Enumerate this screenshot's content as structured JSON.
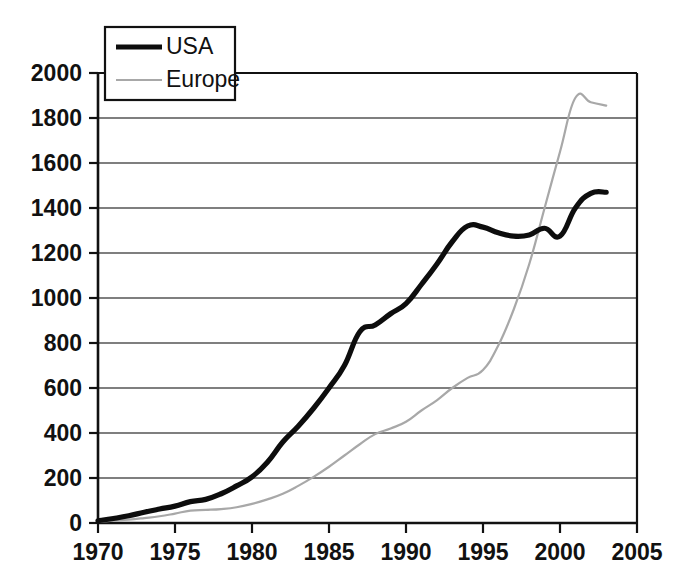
{
  "chart_data": {
    "type": "line",
    "title": "",
    "subtitle": "",
    "xlabel": "",
    "ylabel": "",
    "xlim": [
      1970,
      2005
    ],
    "ylim": [
      0,
      2000
    ],
    "grid": "horizontal",
    "legend_position": "top-left",
    "x_ticks": [
      "1970",
      "1975",
      "1980",
      "1985",
      "1990",
      "1995",
      "2000",
      "2005"
    ],
    "y_ticks": [
      "0",
      "200",
      "400",
      "600",
      "800",
      "1000",
      "1200",
      "1400",
      "1600",
      "1800",
      "2000"
    ],
    "series": [
      {
        "name": "USA",
        "color": "#0d0d0d",
        "x": [
          1970,
          1971,
          1972,
          1973,
          1974,
          1975,
          1976,
          1977,
          1978,
          1979,
          1980,
          1981,
          1982,
          1983,
          1984,
          1985,
          1986,
          1987,
          1988,
          1989,
          1990,
          1991,
          1992,
          1993,
          1994,
          1995,
          1996,
          1997,
          1998,
          1999,
          2000,
          2001,
          2002,
          2003
        ],
        "values": [
          10,
          20,
          32,
          48,
          62,
          75,
          95,
          105,
          130,
          165,
          205,
          270,
          360,
          430,
          510,
          600,
          700,
          850,
          880,
          930,
          975,
          1060,
          1150,
          1250,
          1320,
          1315,
          1290,
          1275,
          1280,
          1310,
          1275,
          1400,
          1465,
          1470
        ]
      },
      {
        "name": "Europe",
        "color": "#a8a8a8",
        "x": [
          1970,
          1971,
          1972,
          1973,
          1974,
          1975,
          1976,
          1977,
          1978,
          1979,
          1980,
          1981,
          1982,
          1983,
          1984,
          1985,
          1986,
          1987,
          1988,
          1989,
          1990,
          1991,
          1992,
          1993,
          1994,
          1995,
          1996,
          1997,
          1998,
          1999,
          2000,
          2001,
          2002,
          2003
        ],
        "values": [
          5,
          10,
          15,
          22,
          30,
          42,
          55,
          58,
          62,
          70,
          85,
          105,
          130,
          165,
          205,
          250,
          300,
          350,
          395,
          420,
          450,
          500,
          545,
          600,
          645,
          680,
          790,
          950,
          1150,
          1400,
          1650,
          1890,
          1870,
          1855
        ]
      }
    ]
  },
  "legend": {
    "items": [
      {
        "label": "USA",
        "color": "#0d0d0d"
      },
      {
        "label": "Europe",
        "color": "#a8a8a8"
      }
    ]
  },
  "axes": {
    "y_tick_labels": [
      "2000",
      "1800",
      "1600",
      "1400",
      "1200",
      "1000",
      "800",
      "600",
      "400",
      "200",
      "0"
    ],
    "x_tick_labels": [
      "1970",
      "1975",
      "1980",
      "1985",
      "1990",
      "1995",
      "2000",
      "2005"
    ]
  }
}
